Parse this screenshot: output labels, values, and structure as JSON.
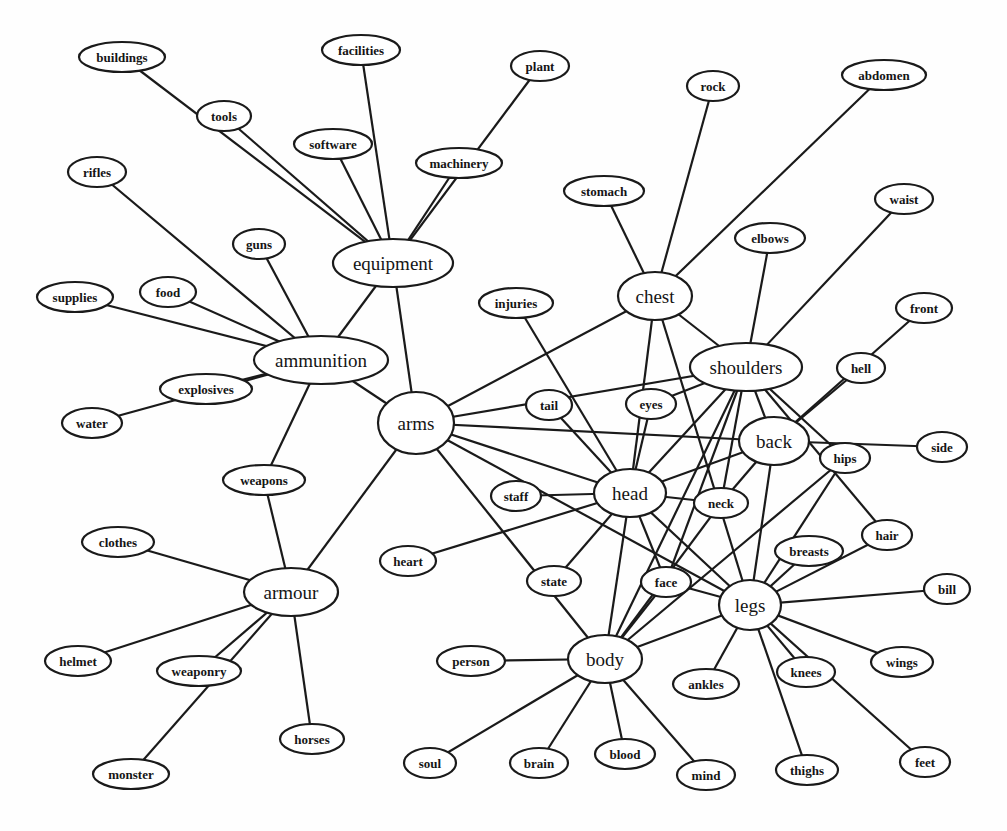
{
  "diagram": {
    "title": "",
    "colors": {
      "stroke": "#1a1a1a",
      "fill": "#ffffff",
      "text": "#151515",
      "background": "#fefefe"
    },
    "nodes": [
      {
        "id": "equipment",
        "label": "equipment",
        "x": 393,
        "y": 263,
        "rx": 60,
        "ry": 24,
        "hub": true
      },
      {
        "id": "ammunition",
        "label": "ammunition",
        "x": 321,
        "y": 360,
        "rx": 67,
        "ry": 24,
        "hub": true
      },
      {
        "id": "arms",
        "label": "arms",
        "x": 416,
        "y": 423,
        "rx": 38,
        "ry": 31,
        "hub": true
      },
      {
        "id": "armour",
        "label": "armour",
        "x": 291,
        "y": 592,
        "rx": 47,
        "ry": 24,
        "hub": true
      },
      {
        "id": "chest",
        "label": "chest",
        "x": 655,
        "y": 296,
        "rx": 37,
        "ry": 24,
        "hub": true
      },
      {
        "id": "shoulders",
        "label": "shoulders",
        "x": 746,
        "y": 367,
        "rx": 56,
        "ry": 24,
        "hub": true
      },
      {
        "id": "back",
        "label": "back",
        "x": 774,
        "y": 441,
        "rx": 35,
        "ry": 24,
        "hub": true
      },
      {
        "id": "head",
        "label": "head",
        "x": 630,
        "y": 493,
        "rx": 36,
        "ry": 24,
        "hub": true
      },
      {
        "id": "legs",
        "label": "legs",
        "x": 750,
        "y": 605,
        "rx": 31,
        "ry": 25,
        "hub": true
      },
      {
        "id": "body",
        "label": "body",
        "x": 605,
        "y": 659,
        "rx": 37,
        "ry": 24,
        "hub": true
      },
      {
        "id": "buildings",
        "label": "buildings",
        "x": 122,
        "y": 57,
        "rx": 43,
        "ry": 15
      },
      {
        "id": "facilities",
        "label": "facilities",
        "x": 361,
        "y": 50,
        "rx": 39,
        "ry": 15
      },
      {
        "id": "plant",
        "label": "plant",
        "x": 540,
        "y": 66,
        "rx": 29,
        "ry": 15
      },
      {
        "id": "tools",
        "label": "tools",
        "x": 224,
        "y": 116,
        "rx": 27,
        "ry": 15
      },
      {
        "id": "software",
        "label": "software",
        "x": 333,
        "y": 144,
        "rx": 39,
        "ry": 15
      },
      {
        "id": "machinery",
        "label": "machinery",
        "x": 459,
        "y": 163,
        "rx": 43,
        "ry": 15
      },
      {
        "id": "rock",
        "label": "rock",
        "x": 713,
        "y": 86,
        "rx": 26,
        "ry": 15
      },
      {
        "id": "abdomen",
        "label": "abdomen",
        "x": 884,
        "y": 75,
        "rx": 42,
        "ry": 15
      },
      {
        "id": "stomach",
        "label": "stomach",
        "x": 604,
        "y": 191,
        "rx": 40,
        "ry": 15
      },
      {
        "id": "waist",
        "label": "waist",
        "x": 904,
        "y": 199,
        "rx": 29,
        "ry": 15
      },
      {
        "id": "elbows",
        "label": "elbows",
        "x": 770,
        "y": 238,
        "rx": 35,
        "ry": 15
      },
      {
        "id": "rifles",
        "label": "rifles",
        "x": 97,
        "y": 172,
        "rx": 29,
        "ry": 15
      },
      {
        "id": "guns",
        "label": "guns",
        "x": 259,
        "y": 244,
        "rx": 26,
        "ry": 15
      },
      {
        "id": "supplies",
        "label": "supplies",
        "x": 75,
        "y": 297,
        "rx": 38,
        "ry": 15
      },
      {
        "id": "food",
        "label": "food",
        "x": 168,
        "y": 292,
        "rx": 28,
        "ry": 15
      },
      {
        "id": "explosives",
        "label": "explosives",
        "x": 206,
        "y": 389,
        "rx": 46,
        "ry": 15
      },
      {
        "id": "water",
        "label": "water",
        "x": 92,
        "y": 423,
        "rx": 30,
        "ry": 15
      },
      {
        "id": "injuries",
        "label": "injuries",
        "x": 516,
        "y": 303,
        "rx": 37,
        "ry": 15
      },
      {
        "id": "front",
        "label": "front",
        "x": 924,
        "y": 308,
        "rx": 28,
        "ry": 15
      },
      {
        "id": "hell",
        "label": "hell",
        "x": 861,
        "y": 368,
        "rx": 24,
        "ry": 15
      },
      {
        "id": "tail",
        "label": "tail",
        "x": 549,
        "y": 405,
        "rx": 23,
        "ry": 15
      },
      {
        "id": "eyes",
        "label": "eyes",
        "x": 651,
        "y": 404,
        "rx": 25,
        "ry": 15
      },
      {
        "id": "side",
        "label": "side",
        "x": 942,
        "y": 447,
        "rx": 25,
        "ry": 15
      },
      {
        "id": "hips",
        "label": "hips",
        "x": 845,
        "y": 458,
        "rx": 25,
        "ry": 15
      },
      {
        "id": "weapons",
        "label": "weapons",
        "x": 264,
        "y": 480,
        "rx": 41,
        "ry": 15
      },
      {
        "id": "staff",
        "label": "staff",
        "x": 516,
        "y": 496,
        "rx": 25,
        "ry": 15
      },
      {
        "id": "neck",
        "label": "neck",
        "x": 721,
        "y": 503,
        "rx": 27,
        "ry": 15
      },
      {
        "id": "hair",
        "label": "hair",
        "x": 887,
        "y": 535,
        "rx": 25,
        "ry": 15
      },
      {
        "id": "clothes",
        "label": "clothes",
        "x": 118,
        "y": 542,
        "rx": 36,
        "ry": 15
      },
      {
        "id": "breasts",
        "label": "breasts",
        "x": 809,
        "y": 551,
        "rx": 34,
        "ry": 15
      },
      {
        "id": "heart",
        "label": "heart",
        "x": 408,
        "y": 561,
        "rx": 28,
        "ry": 15
      },
      {
        "id": "state",
        "label": "state",
        "x": 554,
        "y": 581,
        "rx": 27,
        "ry": 15
      },
      {
        "id": "face",
        "label": "face",
        "x": 666,
        "y": 582,
        "rx": 25,
        "ry": 15
      },
      {
        "id": "bill",
        "label": "bill",
        "x": 947,
        "y": 589,
        "rx": 23,
        "ry": 15
      },
      {
        "id": "helmet",
        "label": "helmet",
        "x": 78,
        "y": 661,
        "rx": 33,
        "ry": 15
      },
      {
        "id": "weaponry",
        "label": "weaponry",
        "x": 199,
        "y": 671,
        "rx": 42,
        "ry": 15
      },
      {
        "id": "person",
        "label": "person",
        "x": 471,
        "y": 661,
        "rx": 34,
        "ry": 15
      },
      {
        "id": "wings",
        "label": "wings",
        "x": 902,
        "y": 662,
        "rx": 31,
        "ry": 15
      },
      {
        "id": "ankles",
        "label": "ankles",
        "x": 706,
        "y": 684,
        "rx": 33,
        "ry": 15
      },
      {
        "id": "knees",
        "label": "knees",
        "x": 806,
        "y": 672,
        "rx": 29,
        "ry": 15
      },
      {
        "id": "horses",
        "label": "horses",
        "x": 312,
        "y": 739,
        "rx": 32,
        "ry": 15
      },
      {
        "id": "monster",
        "label": "monster",
        "x": 131,
        "y": 774,
        "rx": 38,
        "ry": 15
      },
      {
        "id": "soul",
        "label": "soul",
        "x": 430,
        "y": 763,
        "rx": 26,
        "ry": 15
      },
      {
        "id": "brain",
        "label": "brain",
        "x": 539,
        "y": 763,
        "rx": 29,
        "ry": 15
      },
      {
        "id": "blood",
        "label": "blood",
        "x": 625,
        "y": 754,
        "rx": 30,
        "ry": 15
      },
      {
        "id": "mind",
        "label": "mind",
        "x": 706,
        "y": 775,
        "rx": 29,
        "ry": 15
      },
      {
        "id": "thighs",
        "label": "thighs",
        "x": 807,
        "y": 770,
        "rx": 31,
        "ry": 15
      },
      {
        "id": "feet",
        "label": "feet",
        "x": 925,
        "y": 762,
        "rx": 25,
        "ry": 15
      }
    ],
    "edges": [
      [
        "equipment",
        "buildings"
      ],
      [
        "equipment",
        "tools"
      ],
      [
        "equipment",
        "facilities"
      ],
      [
        "equipment",
        "software"
      ],
      [
        "equipment",
        "machinery"
      ],
      [
        "equipment",
        "plant"
      ],
      [
        "equipment",
        "ammunition"
      ],
      [
        "equipment",
        "arms"
      ],
      [
        "ammunition",
        "rifles"
      ],
      [
        "ammunition",
        "guns"
      ],
      [
        "ammunition",
        "supplies"
      ],
      [
        "ammunition",
        "food"
      ],
      [
        "ammunition",
        "explosives"
      ],
      [
        "ammunition",
        "water"
      ],
      [
        "ammunition",
        "weapons"
      ],
      [
        "ammunition",
        "arms"
      ],
      [
        "armour",
        "weapons"
      ],
      [
        "armour",
        "clothes"
      ],
      [
        "armour",
        "helmet"
      ],
      [
        "armour",
        "weaponry"
      ],
      [
        "armour",
        "monster"
      ],
      [
        "armour",
        "horses"
      ],
      [
        "armour",
        "arms"
      ],
      [
        "arms",
        "chest"
      ],
      [
        "arms",
        "shoulders"
      ],
      [
        "arms",
        "back"
      ],
      [
        "arms",
        "head"
      ],
      [
        "arms",
        "legs"
      ],
      [
        "arms",
        "body"
      ],
      [
        "chest",
        "stomach"
      ],
      [
        "chest",
        "rock"
      ],
      [
        "chest",
        "abdomen"
      ],
      [
        "chest",
        "shoulders"
      ],
      [
        "chest",
        "head"
      ],
      [
        "chest",
        "legs"
      ],
      [
        "shoulders",
        "elbows"
      ],
      [
        "shoulders",
        "waist"
      ],
      [
        "shoulders",
        "eyes"
      ],
      [
        "shoulders",
        "back"
      ],
      [
        "shoulders",
        "head"
      ],
      [
        "shoulders",
        "neck"
      ],
      [
        "shoulders",
        "face"
      ],
      [
        "shoulders",
        "body"
      ],
      [
        "shoulders",
        "hips"
      ],
      [
        "shoulders",
        "hair"
      ],
      [
        "back",
        "front"
      ],
      [
        "back",
        "hell"
      ],
      [
        "back",
        "side"
      ],
      [
        "back",
        "head"
      ],
      [
        "back",
        "neck"
      ],
      [
        "back",
        "legs"
      ],
      [
        "head",
        "injuries"
      ],
      [
        "head",
        "tail"
      ],
      [
        "head",
        "eyes"
      ],
      [
        "head",
        "staff"
      ],
      [
        "head",
        "heart"
      ],
      [
        "head",
        "neck"
      ],
      [
        "head",
        "state"
      ],
      [
        "head",
        "face"
      ],
      [
        "head",
        "body"
      ],
      [
        "head",
        "legs"
      ],
      [
        "legs",
        "hips"
      ],
      [
        "legs",
        "breasts"
      ],
      [
        "legs",
        "hair"
      ],
      [
        "legs",
        "bill"
      ],
      [
        "legs",
        "wings"
      ],
      [
        "legs",
        "knees"
      ],
      [
        "legs",
        "ankles"
      ],
      [
        "legs",
        "thighs"
      ],
      [
        "legs",
        "feet"
      ],
      [
        "legs",
        "face"
      ],
      [
        "legs",
        "body"
      ],
      [
        "body",
        "person"
      ],
      [
        "body",
        "soul"
      ],
      [
        "body",
        "brain"
      ],
      [
        "body",
        "blood"
      ],
      [
        "body",
        "mind"
      ],
      [
        "body",
        "face"
      ],
      [
        "body",
        "neck"
      ],
      [
        "body",
        "hips"
      ]
    ]
  }
}
